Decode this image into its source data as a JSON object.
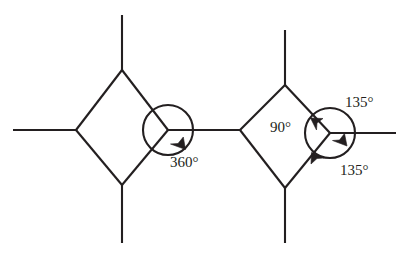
{
  "figure": {
    "background_color": "#ffffff",
    "stroke_color": "#231f20",
    "labels": {
      "full_turn": "360°",
      "quarter_turn": "90°",
      "three_eighths_turn_top": "135°",
      "three_eighths_turn_bottom": "135°"
    },
    "left_vertex": {
      "name": "left-hub",
      "center_x": 168,
      "center_y": 130,
      "circle_radius": 25,
      "annotation": "360°",
      "annotation_x": 170,
      "annotation_y": 164
    },
    "right_vertex": {
      "name": "right-hub",
      "center_x": 330,
      "center_y": 133,
      "circle_radius": 25,
      "annotations": [
        {
          "text": "90°",
          "x": 270,
          "y": 129
        },
        {
          "text": "135°",
          "x": 345,
          "y": 104
        },
        {
          "text": "135°",
          "x": 340,
          "y": 172
        }
      ]
    },
    "left_diamond": {
      "top": {
        "x": 122,
        "y": 70
      },
      "left": {
        "x": 76,
        "y": 130
      },
      "bottom": {
        "x": 122,
        "y": 185
      },
      "right": {
        "x": 168,
        "y": 130
      }
    },
    "right_diamond": {
      "top": {
        "x": 285,
        "y": 85
      },
      "left": {
        "x": 240,
        "y": 130
      },
      "bottom": {
        "x": 285,
        "y": 188
      },
      "right": {
        "x": 330,
        "y": 133
      }
    },
    "stems": [
      {
        "name": "left-top-stem",
        "x1": 122,
        "y1": 70,
        "x2": 122,
        "y2": 15
      },
      {
        "name": "left-west-stem",
        "x1": 76,
        "y1": 130,
        "x2": 13,
        "y2": 130
      },
      {
        "name": "left-bottom-stem",
        "x1": 122,
        "y1": 185,
        "x2": 122,
        "y2": 243
      },
      {
        "name": "right-top-stem",
        "x1": 285,
        "y1": 85,
        "x2": 285,
        "y2": 30
      },
      {
        "name": "right-bottom-stem",
        "x1": 285,
        "y1": 188,
        "x2": 285,
        "y2": 243
      },
      {
        "name": "right-east-stem",
        "x1": 330,
        "y1": 133,
        "x2": 396,
        "y2": 133
      },
      {
        "name": "bridge-stem",
        "x1": 168,
        "y1": 130,
        "x2": 240,
        "y2": 130
      }
    ]
  }
}
